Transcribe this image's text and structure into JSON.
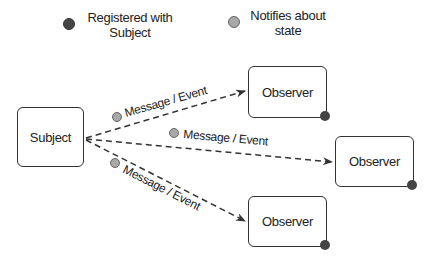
{
  "legend": {
    "items": [
      {
        "icon": "dark-dot-icon",
        "color": "#444444",
        "label_line1": "Registered with",
        "label_line2": "Subject"
      },
      {
        "icon": "light-dot-icon",
        "color": "#a8a8a8",
        "label_line1": "Notifies about",
        "label_line2": "state"
      }
    ]
  },
  "subject": {
    "label": "Subject"
  },
  "observers": [
    {
      "label": "Observer"
    },
    {
      "label": "Observer"
    },
    {
      "label": "Observer"
    }
  ],
  "arrows": [
    {
      "label": "Message / Event",
      "target": "observer-1"
    },
    {
      "label": "Message / Event",
      "target": "observer-2"
    },
    {
      "label": "Message / Event",
      "target": "observer-3"
    }
  ],
  "colors": {
    "line": "#333333",
    "dark_dot": "#444444",
    "light_dot": "#a8a8a8",
    "light_dot_border": "#666666"
  }
}
